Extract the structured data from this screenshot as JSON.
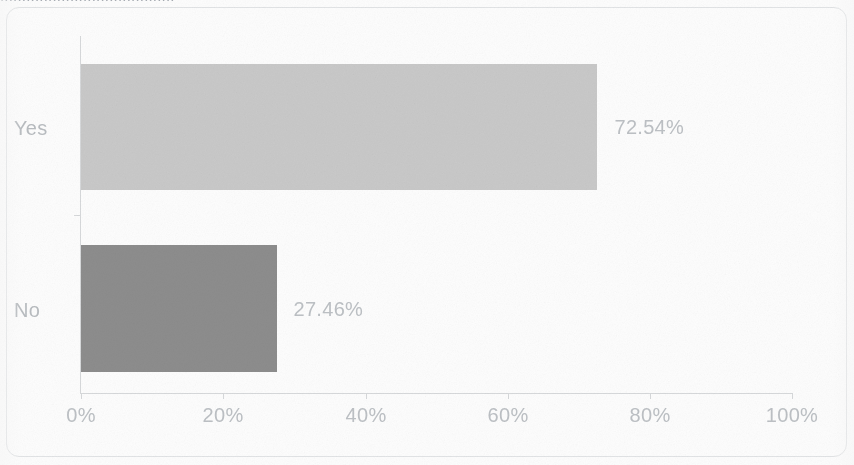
{
  "document": {
    "clipped_title_fragment": "........................................"
  },
  "chart_data": {
    "type": "bar",
    "orientation": "horizontal",
    "title": "",
    "xlabel": "",
    "ylabel": "",
    "categories": [
      "Yes",
      "No"
    ],
    "values": [
      72.54,
      27.46
    ],
    "value_labels": [
      "72.54%",
      "27.46%"
    ],
    "bar_colors": [
      "#c9c9c9",
      "#8d8d8d"
    ],
    "xlim": [
      0,
      100
    ],
    "x_ticks": [
      0,
      20,
      40,
      60,
      80,
      100
    ],
    "x_tick_labels": [
      "0%",
      "20%",
      "40%",
      "60%",
      "80%",
      "100%"
    ],
    "grid": false,
    "legend": false,
    "axis_color": "#d7d9db",
    "text_color": "#bdc1c5",
    "border_color": "#e2e4e6"
  }
}
